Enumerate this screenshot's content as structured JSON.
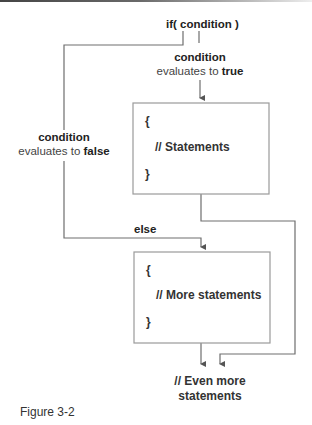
{
  "diagram": {
    "type": "flowchart",
    "top_condition": "if( condition )",
    "true_branch": {
      "label_line1": "condition",
      "label_line2_prefix": "evaluates to ",
      "label_line2_value": "true"
    },
    "false_branch": {
      "label_line1": "condition",
      "label_line2_prefix": "evaluates to ",
      "label_line2_value": "false"
    },
    "else_label": "else",
    "if_block": {
      "open_brace": "{",
      "body": "// Statements",
      "close_brace": "}"
    },
    "else_block": {
      "open_brace": "{",
      "body": "// More statements",
      "close_brace": "}"
    },
    "end_label_line1": "// Even more",
    "end_label_line2": "statements",
    "colors": {
      "line": "#6e6e6e",
      "box_border": "#9a9a9a",
      "text": "#222222"
    }
  },
  "caption": "Figure 3-2"
}
